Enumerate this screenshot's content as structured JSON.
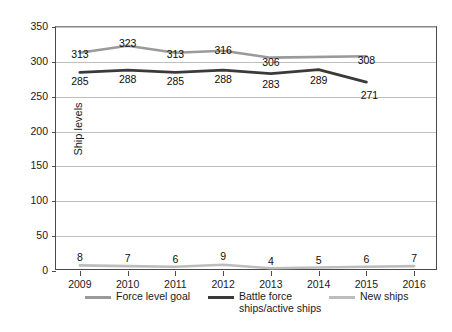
{
  "chart_data": {
    "type": "line",
    "title": "",
    "xlabel": "",
    "ylabel": "Ship levels",
    "categories": [
      "2009",
      "2010",
      "2011",
      "2012",
      "2013",
      "2014",
      "2015",
      "2016"
    ],
    "ylim": [
      0,
      350
    ],
    "y_ticks": [
      0,
      50,
      100,
      150,
      200,
      250,
      300,
      350
    ],
    "grid": true,
    "legend_position": "bottom",
    "series": [
      {
        "name": "Force level goal",
        "color": "#9a9a9a",
        "values": [
          313,
          323,
          313,
          316,
          306,
          null,
          308,
          null
        ],
        "labels": [
          "313",
          "323",
          "313",
          "316",
          "306",
          "",
          "308",
          ""
        ],
        "line_through": [
          313,
          323,
          313,
          316,
          306
        ]
      },
      {
        "name": "Battle force ships/active ships",
        "color": "#3a3a3a",
        "values": [
          285,
          288,
          285,
          288,
          283,
          289,
          271,
          null
        ],
        "labels": [
          "285",
          "288",
          "285",
          "288",
          "283",
          "289",
          "271",
          ""
        ],
        "line_through": [
          285,
          288,
          285,
          288,
          283,
          289,
          271
        ]
      },
      {
        "name": "New ships",
        "color": "#bdbdbd",
        "values": [
          8,
          7,
          6,
          9,
          4,
          5,
          6,
          7
        ],
        "labels": [
          "8",
          "7",
          "6",
          "9",
          "4",
          "5",
          "6",
          "7"
        ],
        "line_through": [
          8,
          7,
          6,
          9,
          4,
          5,
          6,
          7
        ]
      }
    ]
  },
  "axes": {
    "y_tick_labels": [
      "0",
      "50",
      "100",
      "150",
      "200",
      "250",
      "300",
      "350"
    ],
    "y_axis_title": "Ship levels",
    "x_tick_labels": [
      "2009",
      "2010",
      "2011",
      "2012",
      "2013",
      "2014",
      "2015",
      "2016"
    ]
  },
  "legend": {
    "items": [
      {
        "label": "Force level goal",
        "label_line2": "",
        "color": "#9a9a9a"
      },
      {
        "label": "Battle force",
        "label_line2": "ships/active ships",
        "color": "#3a3a3a"
      },
      {
        "label": "New ships",
        "label_line2": "",
        "color": "#bdbdbd"
      }
    ]
  },
  "point_labels": {
    "goal": [
      "313",
      "323",
      "313",
      "316",
      "306",
      "",
      "308",
      ""
    ],
    "battle": [
      "285",
      "288",
      "285",
      "288",
      "283",
      "289",
      "271",
      ""
    ],
    "newships": [
      "8",
      "7",
      "6",
      "9",
      "4",
      "5",
      "6",
      "7"
    ]
  }
}
